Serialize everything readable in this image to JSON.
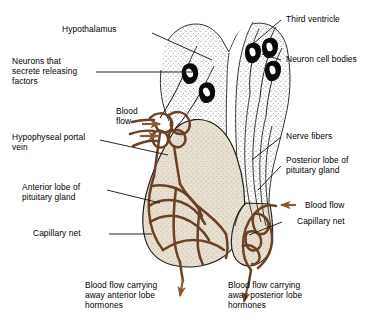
{
  "figure": {
    "background_color": "#ffffff",
    "ink_color": "#000000",
    "vessel_color": "#6b4226",
    "gland_fill_color": "#e7dfd0",
    "stipple_color": "#8a8278"
  },
  "labels": {
    "hypothalamus": "Hypothalamus",
    "neurons_secrete": "Neurons that\nsecrete releasing\nfactors",
    "blood_flow_left": "Blood\nflow",
    "hypophyseal_portal_vein": "Hypophyseal portal\nvein",
    "anterior_lobe": "Anterior lobe of\npituitary gland",
    "capillary_net_left": "Capillary net",
    "third_ventricle": "Third ventricle",
    "neuron_cell_bodies": "Neuron cell bodies",
    "nerve_fibers": "Nerve fibers",
    "posterior_lobe": "Posterior lobe of\npituitary gland",
    "blood_flow_right": "Blood flow",
    "capillary_net_right": "Capillary net",
    "outflow_anterior": "Blood flow carrying\naway anterior lobe\nhormones",
    "outflow_posterior": "Blood flow carrying\naway posterior lobe\nhormones"
  },
  "structures": [
    {
      "name": "hypothalamus",
      "description": "stippled brain tissue above the pituitary"
    },
    {
      "name": "third-ventricle",
      "description": "white V-shaped cleft at center top"
    },
    {
      "name": "neuron-cell-bodies",
      "description": "five black teardrop somata with white nuclei"
    },
    {
      "name": "nerve-fibers",
      "description": "thin black axons descending into posterior lobe"
    },
    {
      "name": "hypophyseal-portal-vein",
      "description": "brown portal vessels at the median eminence"
    },
    {
      "name": "anterior-lobe",
      "description": "large teardrop lobe with brown capillary net"
    },
    {
      "name": "posterior-lobe",
      "description": "smaller lobe at right with brown capillary net"
    }
  ],
  "arrows": [
    {
      "name": "blood-flow-in-left",
      "direction": "right",
      "count": 2
    },
    {
      "name": "blood-flow-in-right",
      "direction": "left",
      "count": 1
    },
    {
      "name": "blood-flow-out-anterior",
      "direction": "down",
      "count": 1
    },
    {
      "name": "blood-flow-out-posterior",
      "direction": "down",
      "count": 1
    }
  ]
}
